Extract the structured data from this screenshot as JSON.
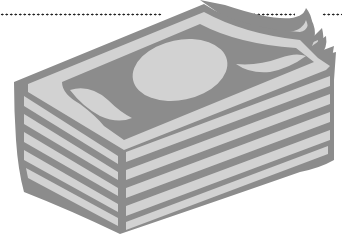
{
  "image": {
    "subject": "stack of banknotes clip-art",
    "colors": {
      "dark": "#8c8c8c",
      "light": "#d2d2d2",
      "background": "#ffffff",
      "dots": "#222222"
    },
    "dotted_lines": [
      {
        "x": 0,
        "width": 162
      },
      {
        "x": 243,
        "width": 52
      },
      {
        "x": 322,
        "width": 20
      }
    ]
  }
}
